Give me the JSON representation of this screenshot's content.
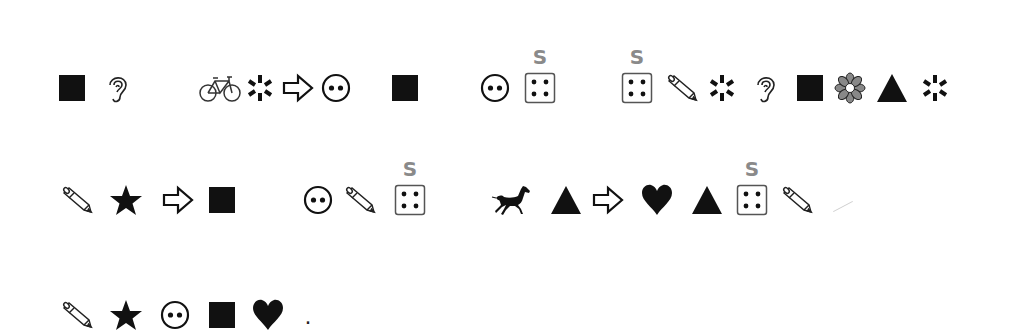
{
  "puzzle": {
    "marker_label": "S",
    "marker_color": "#8a8a8a",
    "terminator": ".",
    "rows": [
      {
        "y": 88,
        "symbols": [
          {
            "icon": "black-square",
            "x": 72
          },
          {
            "icon": "ear",
            "x": 117
          },
          {
            "icon": "bicycle",
            "x": 220
          },
          {
            "icon": "asterisk",
            "x": 260
          },
          {
            "icon": "outline-arrow-right",
            "x": 298
          },
          {
            "icon": "face",
            "x": 336
          },
          {
            "icon": "black-square",
            "x": 405
          },
          {
            "icon": "face",
            "x": 495
          },
          {
            "icon": "die-four",
            "x": 540,
            "label": "S"
          },
          {
            "icon": "die-four",
            "x": 637,
            "label": "S"
          },
          {
            "icon": "pencil",
            "x": 682
          },
          {
            "icon": "asterisk",
            "x": 722
          },
          {
            "icon": "ear",
            "x": 765
          },
          {
            "icon": "black-square",
            "x": 810
          },
          {
            "icon": "flower",
            "x": 850
          },
          {
            "icon": "black-triangle",
            "x": 892
          },
          {
            "icon": "asterisk",
            "x": 935
          }
        ]
      },
      {
        "y": 200,
        "symbols": [
          {
            "icon": "pencil",
            "x": 77
          },
          {
            "icon": "black-star",
            "x": 126
          },
          {
            "icon": "outline-arrow-right",
            "x": 178
          },
          {
            "icon": "black-square",
            "x": 222
          },
          {
            "icon": "face",
            "x": 318
          },
          {
            "icon": "pencil",
            "x": 360
          },
          {
            "icon": "die-four",
            "x": 410,
            "label": "S"
          },
          {
            "icon": "horse",
            "x": 512
          },
          {
            "icon": "black-triangle",
            "x": 566
          },
          {
            "icon": "outline-arrow-right",
            "x": 608
          },
          {
            "icon": "black-heart",
            "x": 657
          },
          {
            "icon": "black-triangle",
            "x": 707
          },
          {
            "icon": "die-four",
            "x": 752,
            "label": "S"
          },
          {
            "icon": "pencil",
            "x": 797
          }
        ]
      },
      {
        "y": 315,
        "symbols": [
          {
            "icon": "pencil",
            "x": 77
          },
          {
            "icon": "black-star",
            "x": 126
          },
          {
            "icon": "face",
            "x": 175
          },
          {
            "icon": "black-square",
            "x": 222
          },
          {
            "icon": "black-heart",
            "x": 268
          }
        ],
        "terminator_x": 308
      }
    ]
  }
}
